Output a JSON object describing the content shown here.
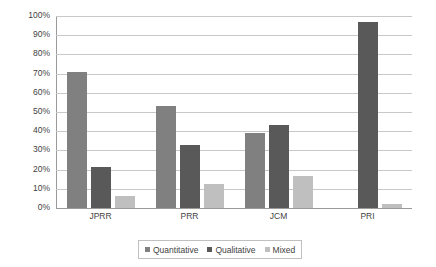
{
  "chart_data": {
    "type": "bar",
    "title": "",
    "subtitle": "",
    "xlabel": "",
    "ylabel": "",
    "categories": [
      "JPRR",
      "PRR",
      "JCM",
      "PRI"
    ],
    "series": [
      {
        "name": "Quantitative",
        "color": "#808080",
        "values": [
          71,
          53,
          39,
          0
        ]
      },
      {
        "name": "Qualitative",
        "color": "#595959",
        "values": [
          21.5,
          33,
          43,
          97
        ]
      },
      {
        "name": "Mixed",
        "color": "#bfbfbf",
        "values": [
          6.5,
          12.5,
          16.5,
          2
        ]
      }
    ],
    "ylim": [
      0,
      100
    ],
    "y_ticks": [
      "0%",
      "10%",
      "20%",
      "30%",
      "40%",
      "50%",
      "60%",
      "70%",
      "80%",
      "90%",
      "100%"
    ],
    "y_tick_values": [
      0,
      10,
      20,
      30,
      40,
      50,
      60,
      70,
      80,
      90,
      100
    ],
    "grid": true,
    "legend_position": "bottom",
    "axis_color": "#9a9a9a",
    "grid_color": "#c8c8c8",
    "text_color": "#3f3f3f",
    "background": "#ffffff"
  }
}
